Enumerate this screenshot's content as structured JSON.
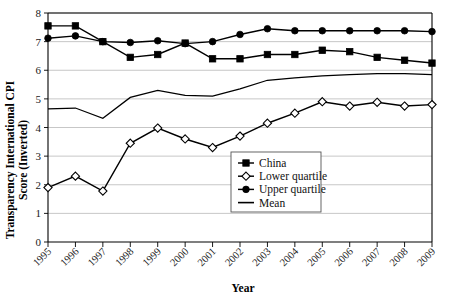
{
  "chart_data": {
    "type": "line",
    "title": "",
    "xlabel": "Year",
    "ylabel": "Transparency International CPI Score (Inverted)",
    "categories": [
      "1995",
      "1996",
      "1997",
      "1998",
      "1999",
      "2000",
      "2001",
      "2002",
      "2003",
      "2004",
      "2005",
      "2006",
      "2007",
      "2008",
      "2009"
    ],
    "x": [
      1995,
      1996,
      1997,
      1998,
      1999,
      2000,
      2001,
      2002,
      2003,
      2004,
      2005,
      2006,
      2007,
      2008,
      2009
    ],
    "ylim": [
      0,
      8
    ],
    "xlim": [
      1995,
      2009
    ],
    "yticks": [
      "0",
      "1",
      "2",
      "3",
      "4",
      "5",
      "6",
      "7",
      "8"
    ],
    "grid": true,
    "legend_position": "lower-right-inside",
    "series": [
      {
        "name": "China",
        "marker": "filled-square",
        "values": [
          7.55,
          7.55,
          7.0,
          6.45,
          6.55,
          6.95,
          6.4,
          6.4,
          6.55,
          6.55,
          6.7,
          6.65,
          6.45,
          6.35,
          6.25
        ]
      },
      {
        "name": "Lower quartile",
        "marker": "open-diamond",
        "values": [
          1.9,
          2.3,
          1.78,
          3.45,
          3.98,
          3.6,
          3.3,
          3.7,
          4.15,
          4.5,
          4.9,
          4.75,
          4.88,
          4.75,
          4.8
        ]
      },
      {
        "name": "Upper quartile",
        "marker": "filled-circle",
        "values": [
          7.12,
          7.2,
          7.0,
          6.97,
          7.03,
          6.93,
          7.0,
          7.25,
          7.45,
          7.38,
          7.38,
          7.38,
          7.38,
          7.38,
          7.35
        ]
      },
      {
        "name": "Mean",
        "marker": "none",
        "values": [
          4.65,
          4.68,
          4.32,
          5.05,
          5.3,
          5.12,
          5.1,
          5.35,
          5.65,
          5.73,
          5.8,
          5.85,
          5.88,
          5.88,
          5.85
        ]
      }
    ]
  },
  "legend": {
    "items": [
      {
        "label": "China",
        "marker": "filled-square"
      },
      {
        "label": "Lower quartile",
        "marker": "open-diamond"
      },
      {
        "label": "Upper quartile",
        "marker": "filled-circle"
      },
      {
        "label": "Mean",
        "marker": "line"
      }
    ]
  },
  "axes": {
    "y_title": "Transparency International CPI Score (Inverted)",
    "y_title_line1": "Transparency International CPI",
    "y_title_line2": "Score (Inverted)",
    "x_title": "Year"
  },
  "colors": {
    "ink": "#000000",
    "grid": "#b9b9b9",
    "background": "#ffffff"
  }
}
